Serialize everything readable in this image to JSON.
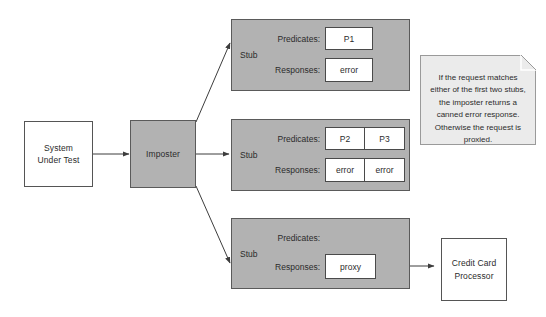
{
  "diagram": {
    "colors": {
      "gray_fill": "#b2b2b2",
      "white_fill": "#ffffff",
      "note_fill": "#ebebeb",
      "stroke": "#555555"
    },
    "nodes": {
      "system_under_test": {
        "label_line1": "System",
        "label_line2": "Under Test"
      },
      "imposter": {
        "label": "Imposter"
      },
      "credit_card_processor": {
        "label_line1": "Credit Card",
        "label_line2": "Processor"
      }
    },
    "stubs": [
      {
        "name": "Stub",
        "predicates_label": "Predicates:",
        "responses_label": "Responses:",
        "predicates": [
          "P1"
        ],
        "responses": [
          "error"
        ]
      },
      {
        "name": "Stub",
        "predicates_label": "Predicates:",
        "responses_label": "Responses:",
        "predicates": [
          "P2",
          "P3"
        ],
        "responses": [
          "error",
          "error"
        ]
      },
      {
        "name": "Stub",
        "predicates_label": "Predicates:",
        "responses_label": "Responses:",
        "predicates": [],
        "responses": [
          "proxy"
        ]
      }
    ],
    "note": {
      "text": "If the request matches either of the first two stubs, the imposter returns a canned error response. Otherwise the request is proxied."
    }
  }
}
